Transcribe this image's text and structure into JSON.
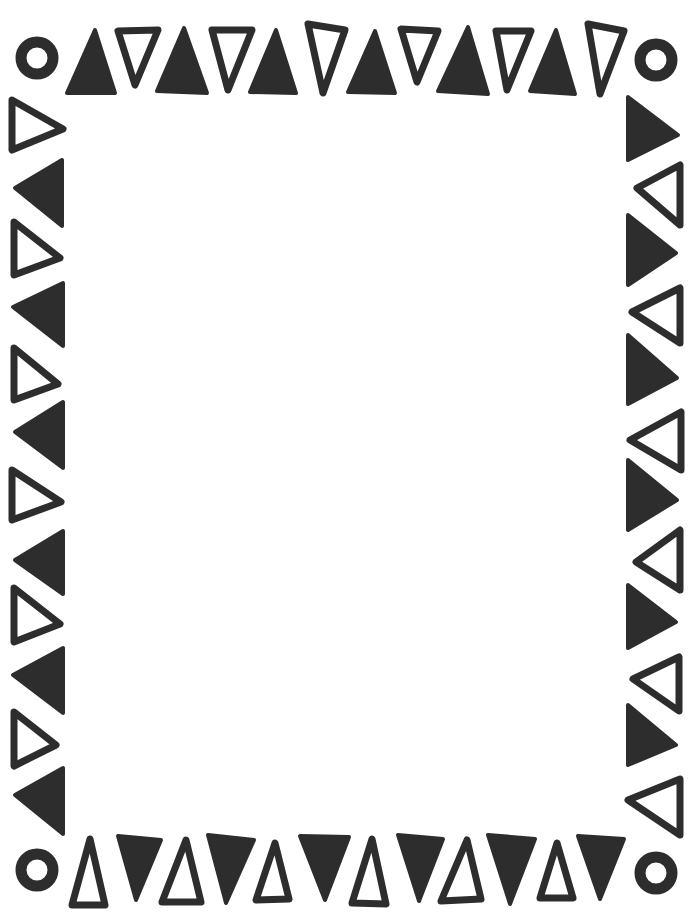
{
  "page": {
    "width": 697,
    "height": 914,
    "background": "#ffffff",
    "ink_color": "#2d2d2d"
  },
  "corners": [
    {
      "name": "ring-top-left",
      "cx": 37,
      "cy": 58,
      "r": 16
    },
    {
      "name": "ring-top-right",
      "cx": 656,
      "cy": 60,
      "r": 16
    },
    {
      "name": "ring-bottom-left",
      "cx": 37,
      "cy": 870,
      "r": 16
    },
    {
      "name": "ring-bottom-right",
      "cx": 656,
      "cy": 873,
      "r": 16
    }
  ],
  "top_row": [
    {
      "style": "filled",
      "points": "95,30 115,93 67,93"
    },
    {
      "style": "outline",
      "points": "118,31 158,30 135,85"
    },
    {
      "style": "filled",
      "points": "184,28 207,93 157,91"
    },
    {
      "style": "outline",
      "points": "212,30 252,30 228,90"
    },
    {
      "style": "filled",
      "points": "276,30 296,93 250,92"
    },
    {
      "style": "outline",
      "points": "308,24 345,30 323,93"
    },
    {
      "style": "filled",
      "points": "375,31 395,93 348,92"
    },
    {
      "style": "outline",
      "points": "401,29 438,31 417,82"
    },
    {
      "style": "filled",
      "points": "468,27 488,94 438,91"
    },
    {
      "style": "outline",
      "points": "496,31 531,31 507,90"
    },
    {
      "style": "filled",
      "points": "556,30 575,94 530,91"
    },
    {
      "style": "outline",
      "points": "588,24 624,31 600,94"
    }
  ],
  "bottom_row": [
    {
      "style": "outline",
      "points": "90,839 105,905 72,905"
    },
    {
      "style": "filled",
      "points": "118,836 161,840 136,900"
    },
    {
      "style": "outline",
      "points": "186,840 201,902 162,902"
    },
    {
      "style": "filled",
      "points": "208,835 254,840 226,903"
    },
    {
      "style": "outline",
      "points": "275,843 289,899 256,900"
    },
    {
      "style": "filled",
      "points": "300,836 349,837 325,900"
    },
    {
      "style": "outline",
      "points": "372,839 386,904 352,903"
    },
    {
      "style": "filled",
      "points": "398,835 443,839 419,901"
    },
    {
      "style": "outline",
      "points": "467,840 481,899 441,901"
    },
    {
      "style": "filled",
      "points": "488,835 535,839 510,904"
    },
    {
      "style": "outline",
      "points": "557,843 573,898 540,898"
    },
    {
      "style": "filled",
      "points": "578,836 624,839 600,899"
    }
  ],
  "left_column": [
    {
      "style": "outline",
      "points": "12,100 63,129 12,150"
    },
    {
      "style": "filled",
      "points": "62,160 62,226 15,188"
    },
    {
      "style": "outline",
      "points": "14,222 60,258 14,275"
    },
    {
      "style": "filled",
      "points": "63,283 63,346 13,307"
    },
    {
      "style": "outline",
      "points": "14,348 58,384 14,400"
    },
    {
      "style": "filled",
      "points": "63,402 63,468 15,432"
    },
    {
      "style": "outline",
      "points": "12,470 61,502 12,520"
    },
    {
      "style": "filled",
      "points": "63,531 63,594 15,560"
    },
    {
      "style": "outline",
      "points": "14,588 60,624 14,642"
    },
    {
      "style": "filled",
      "points": "63,648 63,713 13,675"
    },
    {
      "style": "outline",
      "points": "14,712 56,745 14,766"
    },
    {
      "style": "filled",
      "points": "63,768 63,834 15,795"
    }
  ],
  "right_column": [
    {
      "style": "filled",
      "points": "628,97 678,135 628,160"
    },
    {
      "style": "outline",
      "points": "680,165 680,225 637,188"
    },
    {
      "style": "filled",
      "points": "628,215 676,253 628,285"
    },
    {
      "style": "outline",
      "points": "680,288 680,343 632,312"
    },
    {
      "style": "filled",
      "points": "628,335 677,378 628,404"
    },
    {
      "style": "outline",
      "points": "681,412 681,470 630,440"
    },
    {
      "style": "filled",
      "points": "628,460 677,500 628,530"
    },
    {
      "style": "outline",
      "points": "680,530 680,590 636,562"
    },
    {
      "style": "filled",
      "points": "628,585 676,622 628,648"
    },
    {
      "style": "outline",
      "points": "679,657 679,711 633,679"
    },
    {
      "style": "filled",
      "points": "628,705 676,745 628,765"
    },
    {
      "style": "outline",
      "points": "680,779 680,835 628,800"
    }
  ]
}
